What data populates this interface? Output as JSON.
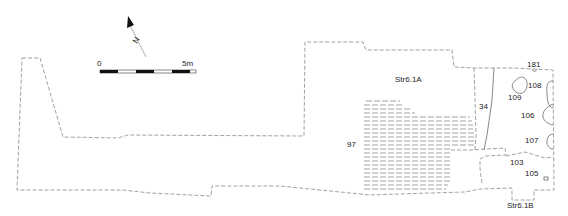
{
  "scale_bar": {
    "start_label": "0",
    "end_label": "5m",
    "segments": 5
  },
  "north_arrow": {
    "label": "N"
  },
  "structures": [
    {
      "id": "str-6-1a",
      "label": "Str6.1A"
    },
    {
      "id": "str-6-1b",
      "label": "Str6.1B"
    }
  ],
  "contexts": [
    {
      "id": "ctx-97",
      "label": "97"
    },
    {
      "id": "ctx-34",
      "label": "34"
    },
    {
      "id": "ctx-181",
      "label": "181"
    },
    {
      "id": "ctx-108",
      "label": "108"
    },
    {
      "id": "ctx-109",
      "label": "109"
    },
    {
      "id": "ctx-106",
      "label": "106"
    },
    {
      "id": "ctx-107",
      "label": "107"
    },
    {
      "id": "ctx-103",
      "label": "103"
    },
    {
      "id": "ctx-105",
      "label": "105"
    }
  ],
  "colors": {
    "outline": "#8a8a8a",
    "feature": "#6a6a6a",
    "text": "#222222",
    "scale_dark": "#111111"
  }
}
